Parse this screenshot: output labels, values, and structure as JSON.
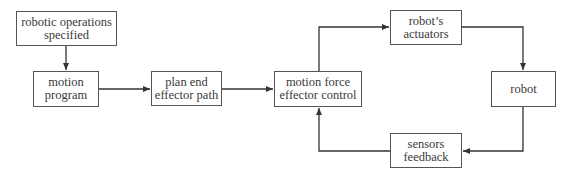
{
  "diagram": {
    "colors": {
      "line": "#333333",
      "border": "#555555",
      "text": "#3a3a3a",
      "background": "#ffffff"
    },
    "nodes": {
      "ops": {
        "line1": "robotic operations",
        "line2": "specified"
      },
      "program": {
        "line1": "motion",
        "line2": "program"
      },
      "plan": {
        "line1": "plan end",
        "line2": "effector path"
      },
      "control": {
        "line1": "motion force",
        "line2": "effector control"
      },
      "actuators": {
        "line1": "robot’s",
        "line2": "actuators"
      },
      "robot": {
        "line1": "robot"
      },
      "sensors": {
        "line1": "sensors",
        "line2": "feedback"
      }
    },
    "edges": [
      {
        "from": "robotic operations specified",
        "to": "motion program"
      },
      {
        "from": "motion program",
        "to": "plan end effector path"
      },
      {
        "from": "plan end effector path",
        "to": "motion force effector control"
      },
      {
        "from": "motion force effector control",
        "to": "robot's actuators"
      },
      {
        "from": "robot's actuators",
        "to": "robot"
      },
      {
        "from": "robot",
        "to": "sensors feedback"
      },
      {
        "from": "sensors feedback",
        "to": "motion force effector control"
      }
    ]
  }
}
